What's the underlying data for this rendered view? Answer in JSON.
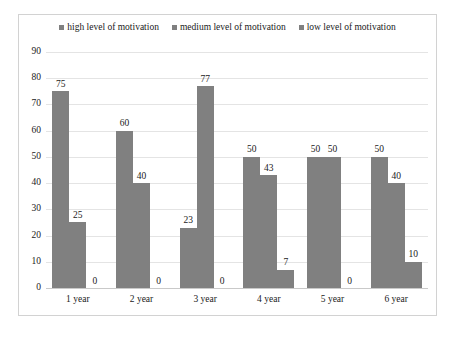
{
  "chart_data": {
    "type": "bar",
    "title": "",
    "xlabel": "",
    "ylabel": "",
    "ylim": [
      0,
      90
    ],
    "ytick_step": 10,
    "yticks": [
      0,
      10,
      20,
      30,
      40,
      50,
      60,
      70,
      80,
      90
    ],
    "grid": true,
    "legend_position": "top-center",
    "categories": [
      "1 year",
      "2 year",
      "3 year",
      "4 year",
      "5 year",
      "6 year"
    ],
    "series": [
      {
        "name": "high level of motivation",
        "color": "#808080",
        "values": [
          75,
          60,
          23,
          50,
          50,
          50
        ]
      },
      {
        "name": "medium level of motivation",
        "color": "#808080",
        "values": [
          25,
          40,
          77,
          43,
          50,
          40
        ]
      },
      {
        "name": "low level of  motivation",
        "color": "#808080",
        "values": [
          0,
          0,
          0,
          7,
          0,
          10
        ]
      }
    ]
  },
  "caption": {
    "text": ""
  }
}
